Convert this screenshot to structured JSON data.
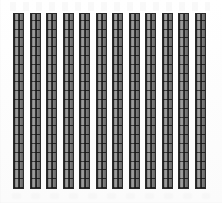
{
  "chart_data": {
    "type": "bar",
    "title": "",
    "subtitle": "",
    "xlabel": "",
    "ylabel": "",
    "grid": false,
    "legend": null,
    "legend_position": "none",
    "categories": [
      "1",
      "2",
      "3",
      "4",
      "5",
      "6",
      "7",
      "8",
      "9",
      "10",
      "11",
      "12"
    ],
    "values": [
      20,
      20,
      20,
      20,
      20,
      20,
      20,
      20,
      20,
      20,
      20,
      20
    ],
    "ylim": [
      0,
      20
    ],
    "xticklabels": [],
    "yticklabels": [],
    "annotations": [],
    "series": [
      {
        "name": "",
        "values": [
          20,
          20,
          20,
          20,
          20,
          20,
          20,
          20,
          20,
          20,
          20,
          20
        ]
      }
    ],
    "bar_style": {
      "fill_color": "#8a8a8a",
      "edge_color": "#2b2b2b",
      "cell_line_color": "#141414",
      "cells_across": 2,
      "cells_down": 20
    },
    "background_color": "#fefefe"
  },
  "figure": {
    "bar_count": 12,
    "bar_width_px": 11,
    "bar_pitch_px": 16.5,
    "plot_left_px": 13,
    "plot_top_px": 13,
    "plot_bottom_px": 189
  }
}
